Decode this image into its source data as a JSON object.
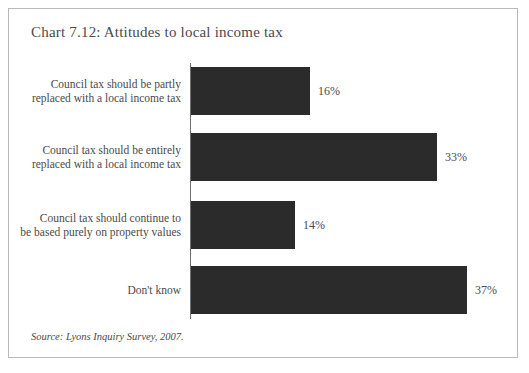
{
  "figure": {
    "title": "Chart 7.12: Attitudes to local income tax",
    "source": "Source: Lyons Inquiry Survey, 2007."
  },
  "chart_data": {
    "type": "bar",
    "orientation": "horizontal",
    "title": "Chart 7.12: Attitudes to local income tax",
    "xlabel": "",
    "ylabel": "",
    "xlim": [
      0,
      40
    ],
    "grid": false,
    "legend": null,
    "value_suffix": "%",
    "bar_color": "#2b2b2b",
    "axis_color": "#6e6e6e",
    "categories": [
      "Council tax should be partly\nreplaced with a local income tax",
      "Council tax should be entirely\nreplaced with a local income tax",
      "Council tax should continue to\nbe based purely on property values",
      "Don't know"
    ],
    "values": [
      16,
      33,
      14,
      37
    ],
    "value_labels": [
      "16%",
      "33%",
      "14%",
      "37%"
    ],
    "annotations": [
      "Source: Lyons Inquiry Survey, 2007."
    ]
  }
}
